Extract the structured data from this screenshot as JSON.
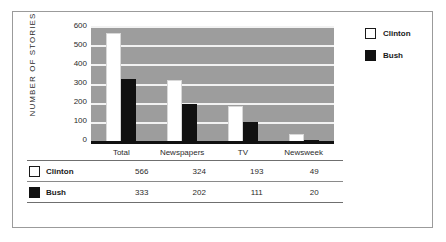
{
  "chart_data": {
    "type": "bar",
    "title": "",
    "xlabel": "",
    "ylabel": "NUMBER OF STORIES",
    "ylim": [
      0,
      600
    ],
    "yticks": [
      600,
      500,
      400,
      300,
      200,
      100,
      0
    ],
    "grid": true,
    "legend_position": "right",
    "categories": [
      "Total",
      "Newspapers",
      "TV",
      "Newsweek"
    ],
    "series": [
      {
        "name": "Clinton",
        "color": "#ffffff",
        "values": [
          566,
          324,
          193,
          49
        ]
      },
      {
        "name": "Bush",
        "color": "#111111",
        "values": [
          333,
          202,
          111,
          20
        ]
      }
    ]
  },
  "legend": {
    "items": [
      {
        "label": "Clinton",
        "swatch": "white-swatch"
      },
      {
        "label": "Bush",
        "swatch": "black-swatch"
      }
    ]
  },
  "table": {
    "header": [
      "",
      "Total",
      "Newspapers",
      "TV",
      "Newsweek"
    ],
    "rows": [
      {
        "name": "Clinton",
        "values": [
          "566",
          "324",
          "193",
          "49"
        ]
      },
      {
        "name": "Bush",
        "values": [
          "333",
          "202",
          "111",
          "20"
        ]
      }
    ]
  },
  "colors": {
    "plot_background": "#9d9d9d",
    "gridline": "#f2f2f2",
    "axis": "#111111",
    "frame_border": "#9b9b9b",
    "text": "#2b2b2b"
  }
}
